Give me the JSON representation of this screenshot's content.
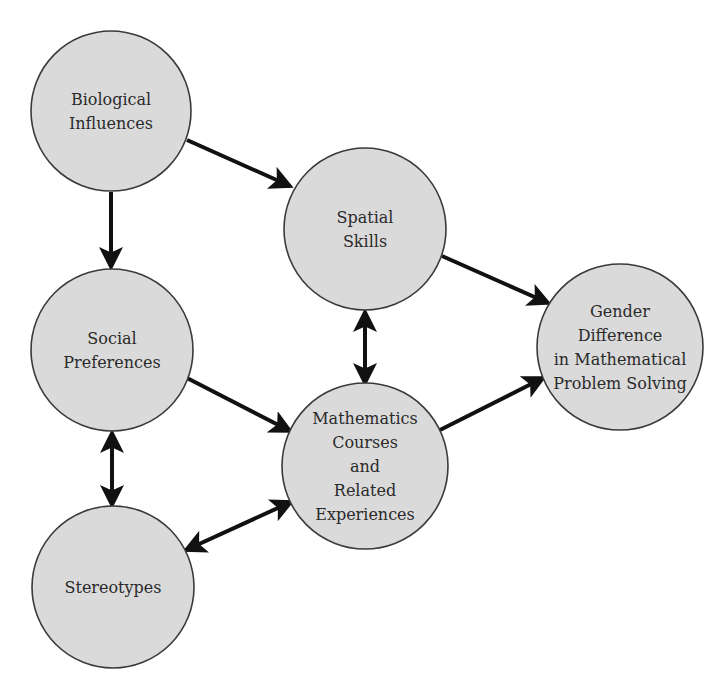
{
  "diagram": {
    "type": "causal-flow",
    "node_fill": "#dadada",
    "node_stroke": "#3a3a3a",
    "edge_color": "#111111",
    "nodes": [
      {
        "id": "biological",
        "name": "node-biological-influences",
        "lines": [
          "Biological",
          "Influences"
        ],
        "cx": 111,
        "cy": 111,
        "r": 80
      },
      {
        "id": "spatial",
        "name": "node-spatial-skills",
        "lines": [
          "Spatial",
          "Skills"
        ],
        "cx": 365,
        "cy": 229,
        "r": 81
      },
      {
        "id": "social",
        "name": "node-social-preferences",
        "lines": [
          "Social",
          "Preferences"
        ],
        "cx": 112,
        "cy": 350,
        "r": 81
      },
      {
        "id": "gender",
        "name": "node-gender-difference",
        "lines": [
          "Gender",
          "Difference",
          "in Mathematical",
          "Problem Solving"
        ],
        "cx": 620,
        "cy": 347,
        "r": 83
      },
      {
        "id": "math",
        "name": "node-mathematics-courses",
        "lines": [
          "Mathematics",
          "Courses",
          "and",
          "Related",
          "Experiences"
        ],
        "cx": 365,
        "cy": 466,
        "r": 83
      },
      {
        "id": "stereotypes",
        "name": "node-stereotypes",
        "lines": [
          "Stereotypes"
        ],
        "cx": 113,
        "cy": 587,
        "r": 81
      }
    ],
    "edges": [
      {
        "from": "biological",
        "to": "spatial",
        "direction": "forward",
        "x1": 187,
        "y1": 140,
        "x2": 290,
        "y2": 186
      },
      {
        "from": "biological",
        "to": "social",
        "direction": "forward",
        "x1": 111,
        "y1": 192,
        "x2": 111,
        "y2": 267
      },
      {
        "from": "spatial",
        "to": "gender",
        "direction": "forward",
        "x1": 442,
        "y1": 256,
        "x2": 548,
        "y2": 303
      },
      {
        "from": "spatial",
        "to": "math",
        "direction": "both",
        "x1": 365,
        "y1": 312,
        "x2": 365,
        "y2": 383
      },
      {
        "from": "social",
        "to": "math",
        "direction": "forward",
        "x1": 187,
        "y1": 378,
        "x2": 290,
        "y2": 431
      },
      {
        "from": "social",
        "to": "stereotypes",
        "direction": "both",
        "x1": 112,
        "y1": 433,
        "x2": 112,
        "y2": 505
      },
      {
        "from": "math",
        "to": "gender",
        "direction": "forward",
        "x1": 440,
        "y1": 430,
        "x2": 543,
        "y2": 378
      },
      {
        "from": "stereotypes",
        "to": "math",
        "direction": "both",
        "x1": 186,
        "y1": 550,
        "x2": 291,
        "y2": 502
      }
    ]
  }
}
